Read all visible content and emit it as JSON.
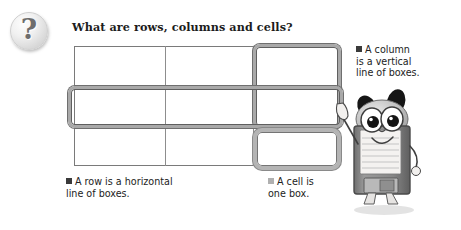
{
  "figure": {
    "badge_icon": "question-mark-icon",
    "badge_glyph": "?",
    "title": "What are rows, columns and cells?",
    "background_color": "#ffffff"
  },
  "grid": {
    "rows": 3,
    "columns": 3,
    "line_color": "#8d8d8d",
    "cells": [
      [
        "",
        "",
        ""
      ],
      [
        "",
        "",
        ""
      ],
      [
        "",
        "",
        ""
      ]
    ]
  },
  "highlights": [
    {
      "name": "column-highlight",
      "target": "third column",
      "shape": "rounded-rectangle",
      "stroke_color": "#a9a9a9"
    },
    {
      "name": "row-highlight",
      "target": "second row",
      "shape": "rounded-rectangle",
      "stroke_color": "#a9a9a9"
    },
    {
      "name": "cell-highlight",
      "target": "bottom-right cell",
      "shape": "rounded-rectangle",
      "stroke_color": "#b4b4b4"
    }
  ],
  "captions": {
    "column": {
      "bullet": "square-bullet-dark",
      "bullet_color": "#3a3a3a",
      "lines": [
        "A column",
        "is a vertical",
        "line of boxes."
      ],
      "text": "A column is a vertical line of boxes."
    },
    "row": {
      "bullet": "square-bullet-dark",
      "bullet_color": "#3a3a3a",
      "lines": [
        "A row is a horizontal",
        "line of boxes."
      ],
      "text": "A row is a horizontal line of boxes."
    },
    "cell": {
      "bullet": "square-bullet-light",
      "bullet_color": "#b0b0b0",
      "lines": [
        "A cell is",
        "one box."
      ],
      "text": "A cell is one box."
    }
  },
  "mascot": {
    "name": "floppy-disk-character",
    "description": "Cartoon floppy disk character with panda ears pointing at the grid",
    "body_color": "#8e8e8e",
    "label_color": "#f2f0ee",
    "ear_color": "#1a1a1a"
  }
}
